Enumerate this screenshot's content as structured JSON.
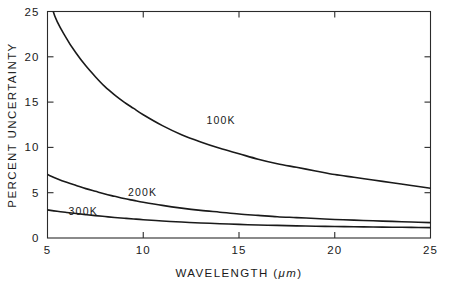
{
  "chart_data": {
    "type": "line",
    "title": "",
    "xlabel": "WAVELENGTH (μm)",
    "xlabel_main": "WAVELENGTH (",
    "xlabel_unit": "μm",
    "xlabel_close": ")",
    "ylabel": "PERCENT UNCERTAINTY",
    "xlim": [
      5,
      25
    ],
    "ylim": [
      0,
      25
    ],
    "grid": false,
    "legend": "inline-curve-labels",
    "xticks": [
      5,
      10,
      15,
      20,
      25
    ],
    "xtick_labels": [
      "5",
      "10",
      "15",
      "20",
      "25"
    ],
    "yticks": [
      0,
      5,
      10,
      15,
      20,
      25
    ],
    "ytick_labels": [
      "0",
      "5",
      "10",
      "15",
      "20",
      "25"
    ],
    "series": [
      {
        "name": "100K",
        "label": "100K",
        "label_x": 13.3,
        "label_y": 12.6,
        "x": [
          5.0,
          5.3,
          6.0,
          6.5,
          7.0,
          7.5,
          8.0,
          8.5,
          9.0,
          9.5,
          10.0,
          11.0,
          12.0,
          13.0,
          14.0,
          15.0,
          16.0,
          17.0,
          18.0,
          19.0,
          20.0,
          21.0,
          22.0,
          23.0,
          24.0,
          25.0
        ],
        "y": [
          29.5,
          25.0,
          22.0,
          20.4,
          19.0,
          17.8,
          16.7,
          15.8,
          15.0,
          14.3,
          13.6,
          12.4,
          11.4,
          10.6,
          9.9,
          9.3,
          8.7,
          8.2,
          7.8,
          7.4,
          7.0,
          6.7,
          6.4,
          6.1,
          5.8,
          5.5
        ]
      },
      {
        "name": "200K",
        "label": "200K",
        "label_x": 9.2,
        "label_y": 4.6,
        "x": [
          5.0,
          5.5,
          6.0,
          6.5,
          7.0,
          7.5,
          8.0,
          8.5,
          9.0,
          9.5,
          10.0,
          11.0,
          12.0,
          13.0,
          14.0,
          15.0,
          16.0,
          17.0,
          18.0,
          19.0,
          20.0,
          21.0,
          22.0,
          23.0,
          24.0,
          25.0
        ],
        "y": [
          7.0,
          6.55,
          6.15,
          5.8,
          5.45,
          5.15,
          4.85,
          4.6,
          4.35,
          4.15,
          3.95,
          3.6,
          3.3,
          3.05,
          2.85,
          2.65,
          2.5,
          2.35,
          2.25,
          2.15,
          2.05,
          1.97,
          1.9,
          1.83,
          1.77,
          1.7
        ]
      },
      {
        "name": "300K",
        "label": "300K",
        "label_x": 6.1,
        "label_y": 2.55,
        "x": [
          5.0,
          5.5,
          6.0,
          6.5,
          7.0,
          7.5,
          8.0,
          8.5,
          9.0,
          9.5,
          10.0,
          11.0,
          12.0,
          13.0,
          14.0,
          15.0,
          16.0,
          17.0,
          18.0,
          19.0,
          20.0,
          21.0,
          22.0,
          23.0,
          24.0,
          25.0
        ],
        "y": [
          3.1,
          2.95,
          2.82,
          2.7,
          2.58,
          2.47,
          2.37,
          2.27,
          2.18,
          2.1,
          2.02,
          1.88,
          1.76,
          1.66,
          1.58,
          1.5,
          1.44,
          1.39,
          1.34,
          1.3,
          1.27,
          1.24,
          1.21,
          1.19,
          1.17,
          1.15
        ]
      }
    ],
    "colors": {
      "curve": "#1a1a1a",
      "axis": "#2b2b2b",
      "background": "#ffffff"
    }
  }
}
